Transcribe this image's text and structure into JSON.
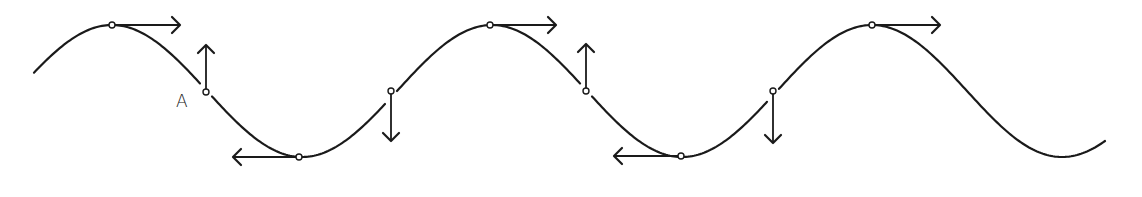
{
  "diagram": {
    "title": "",
    "colors": {
      "stroke": "#1a1a1a",
      "background": "#ffffff",
      "point_fill": "#ffffff"
    },
    "wave": {
      "x_start": 34,
      "x_end": 1105,
      "center_y": 91,
      "amplitude": 66,
      "period": 380,
      "first_peak_x": 112
    },
    "points": [
      {
        "id": "crest-1",
        "x": 112,
        "y": 25,
        "arrow": {
          "dir": "right",
          "x2": 180,
          "y2": 25
        }
      },
      {
        "id": "A",
        "x": 206,
        "y": 92,
        "arrow": {
          "dir": "up",
          "x2": 206,
          "y2": 45
        },
        "label": "A"
      },
      {
        "id": "trough-1",
        "x": 299,
        "y": 157,
        "arrow": {
          "dir": "left",
          "x2": 233,
          "y2": 157
        }
      },
      {
        "id": "rise-1",
        "x": 391,
        "y": 91,
        "arrow": {
          "dir": "down",
          "x2": 391,
          "y2": 141
        }
      },
      {
        "id": "crest-2",
        "x": 490,
        "y": 25,
        "arrow": {
          "dir": "right",
          "x2": 556,
          "y2": 25
        }
      },
      {
        "id": "fall-2",
        "x": 586,
        "y": 91,
        "arrow": {
          "dir": "up",
          "x2": 586,
          "y2": 44
        }
      },
      {
        "id": "trough-2",
        "x": 681,
        "y": 156,
        "arrow": {
          "dir": "left",
          "x2": 614,
          "y2": 156
        }
      },
      {
        "id": "rise-2",
        "x": 773,
        "y": 91,
        "arrow": {
          "dir": "down",
          "x2": 773,
          "y2": 143
        }
      },
      {
        "id": "crest-3",
        "x": 872,
        "y": 25,
        "arrow": {
          "dir": "right",
          "x2": 940,
          "y2": 25
        }
      }
    ],
    "labels": [
      {
        "id": "label-A",
        "text": "A",
        "x": 176,
        "y": 93
      }
    ]
  }
}
